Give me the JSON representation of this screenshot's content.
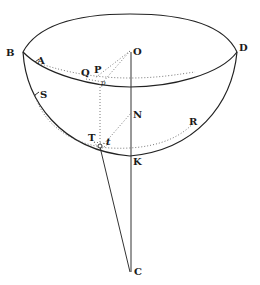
{
  "figure": {
    "type": "geometric diagram",
    "colors": {
      "ink": "#222222",
      "background": "#ffffff",
      "dotted": "#555555"
    }
  },
  "labels": {
    "B": "B",
    "D": "D",
    "O": "O",
    "A": "A",
    "Q": "Q",
    "P": "P",
    "p": "p",
    "S": "S",
    "N": "N",
    "R": "R",
    "T": "T",
    "t": "t",
    "K": "K",
    "C": "C"
  }
}
